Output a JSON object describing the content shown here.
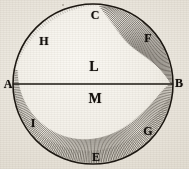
{
  "figure": {
    "kind": "antique-engraved-geometric-diagram",
    "medium_tone": "aged paper",
    "canvas": {
      "width": 189,
      "height": 169
    },
    "colors": {
      "paper_light": "#f2efe8",
      "paper_mid": "#e7e2d8",
      "paper_dark": "#ded8cc",
      "ink": "#14100c",
      "ink_line": "#1d1812",
      "hatch": "#241e16"
    },
    "circle": {
      "center_x": 93,
      "center_y": 84,
      "radius": 80,
      "stroke_width": 1.6
    },
    "chord": {
      "label": "A-B diameter",
      "x1": 13,
      "y1": 84,
      "x2": 173,
      "y2": 84,
      "stroke_width": 1.4
    },
    "shading": {
      "description": "crescent hatching along right and lower limb",
      "hatch_line_count": 150,
      "upper_right_arc_start_deg": -78,
      "upper_right_arc_end_deg": 0,
      "lower_arc_start_deg": 0,
      "lower_arc_end_deg": 190
    }
  },
  "labels": {
    "arc_points": [
      {
        "id": "C",
        "text": "C",
        "x": 95,
        "y": 15,
        "role": "top-of-circle"
      },
      {
        "id": "F",
        "text": "F",
        "x": 148,
        "y": 38,
        "role": "upper-right-arc"
      },
      {
        "id": "H",
        "text": "H",
        "x": 44,
        "y": 41,
        "role": "upper-left-arc"
      },
      {
        "id": "G",
        "text": "G",
        "x": 148,
        "y": 131,
        "role": "lower-right-arc"
      },
      {
        "id": "I",
        "text": "I",
        "x": 33,
        "y": 123,
        "role": "lower-left-arc"
      },
      {
        "id": "E",
        "text": "E",
        "x": 96,
        "y": 157,
        "role": "bottom-of-circle"
      }
    ],
    "chord_endpoints": [
      {
        "id": "A",
        "text": "A",
        "x": 8,
        "y": 84,
        "role": "left-chord-endpoint"
      },
      {
        "id": "B",
        "text": "B",
        "x": 179,
        "y": 83,
        "role": "right-chord-endpoint"
      }
    ],
    "regions": [
      {
        "id": "L",
        "text": "L",
        "x": 94,
        "y": 67,
        "role": "upper-hemisphere-region"
      },
      {
        "id": "M",
        "text": "M",
        "x": 95,
        "y": 99,
        "role": "lower-hemisphere-region"
      }
    ]
  },
  "artifacts": {
    "speck": {
      "x": 62,
      "y": 4
    }
  }
}
